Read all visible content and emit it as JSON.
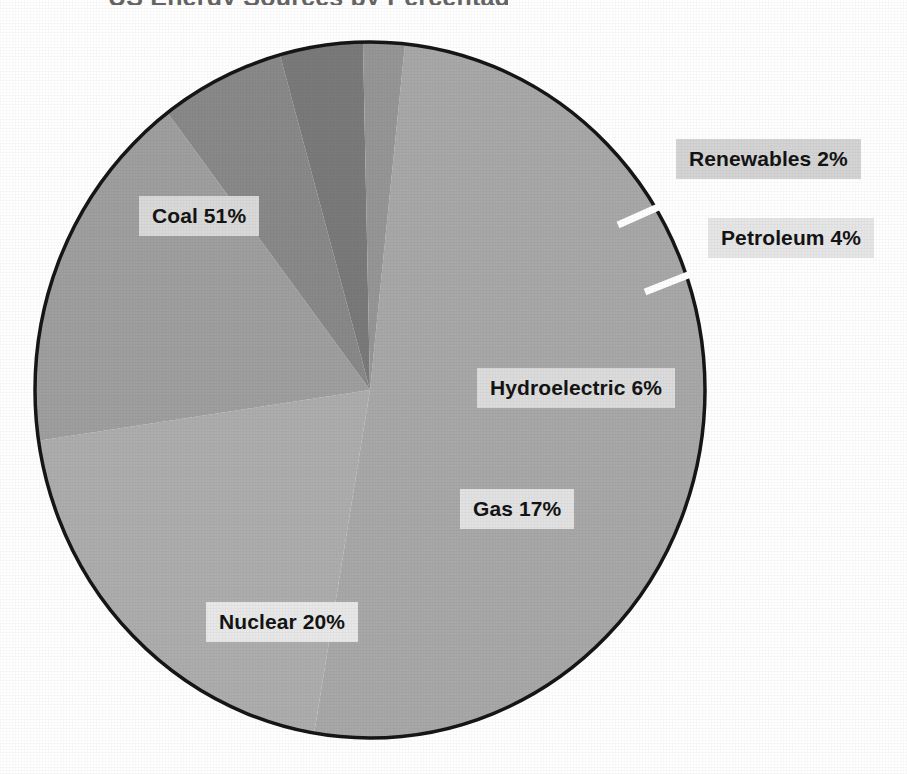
{
  "page": {
    "title_fragment": "US Energy Sources by Percentage",
    "background_color": "#ffffff",
    "width": 907,
    "height": 774
  },
  "chart_data": {
    "type": "pie",
    "title": "US Energy Sources by Percentage",
    "xlabel": "",
    "ylabel": "",
    "legend_position": "none",
    "grid": false,
    "categories": [
      "Coal",
      "Nuclear",
      "Gas",
      "Hydroelectric",
      "Petroleum",
      "Renewables"
    ],
    "values": [
      51,
      20,
      17,
      6,
      4,
      2
    ],
    "unit": "%",
    "total": 100,
    "slices": [
      {
        "name": "Coal",
        "value": 51,
        "label": "Coal 51%",
        "color": "#a8a8a8",
        "start_angle_deg": 6,
        "end_angle_deg": 189.6,
        "label_position": "inside-upper-left",
        "leader_line": false
      },
      {
        "name": "Nuclear",
        "value": 20,
        "label": "Nuclear 20%",
        "color": "#adadad",
        "start_angle_deg": 189.6,
        "end_angle_deg": 261.6,
        "label_position": "inside-lower-left",
        "leader_line": false
      },
      {
        "name": "Gas",
        "value": 17,
        "label": "Gas 17%",
        "color": "#9f9f9f",
        "start_angle_deg": 261.6,
        "end_angle_deg": 322.8,
        "label_position": "inside-lower-right",
        "leader_line": false
      },
      {
        "name": "Hydroelectric",
        "value": 6,
        "label": "Hydroelectric 6%",
        "color": "#898989",
        "start_angle_deg": 322.8,
        "end_angle_deg": 344.4,
        "label_position": "inside-right",
        "leader_line": false
      },
      {
        "name": "Petroleum",
        "value": 4,
        "label": "Petroleum 4%",
        "color": "#7a7a7a",
        "start_angle_deg": 344.4,
        "end_angle_deg": 358.8,
        "label_position": "outside-right",
        "leader_line": true
      },
      {
        "name": "Renewables",
        "value": 2,
        "label": "Renewables 2%",
        "color": "#969696",
        "start_angle_deg": 358.8,
        "end_angle_deg": 366,
        "label_position": "outside-upper-right",
        "leader_line": true
      }
    ],
    "geometry": {
      "center_x": 370,
      "center_y": 390,
      "radius_x": 335,
      "radius_y": 348,
      "outline_color": "#161616",
      "outline_width": 3
    }
  },
  "labels": {
    "coal": "Coal 51%",
    "nuclear": "Nuclear 20%",
    "gas": "Gas 17%",
    "hydroelectric": "Hydroelectric 6%",
    "petroleum": "Petroleum 4%",
    "renewables": "Renewables 2%"
  },
  "colors": {
    "label_chip_background": "#dedede",
    "label_text": "#141414",
    "pie_outline": "#161616",
    "leader_line": "#ffffff",
    "page_background": "#ffffff"
  }
}
